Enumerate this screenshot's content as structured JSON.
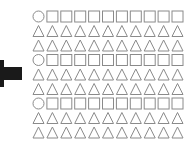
{
  "figure": {
    "arrow": {
      "direction": "pointer",
      "color": "#1a1a1a"
    },
    "grid": {
      "columns": 11,
      "rows": [
        {
          "first": "circle",
          "rest": "square"
        },
        {
          "first": "triangle",
          "rest": "triangle"
        },
        {
          "first": "triangle",
          "rest": "triangle"
        },
        {
          "first": "circle",
          "rest": "square"
        },
        {
          "first": "triangle",
          "rest": "triangle"
        },
        {
          "first": "triangle",
          "rest": "triangle"
        },
        {
          "first": "circle",
          "rest": "square"
        },
        {
          "first": "triangle",
          "rest": "triangle"
        },
        {
          "first": "triangle",
          "rest": "triangle"
        }
      ],
      "stroke_color": "#8a8a8a"
    }
  }
}
